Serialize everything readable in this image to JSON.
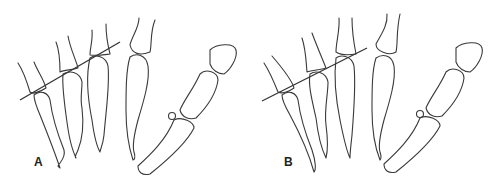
{
  "figure": {
    "panels": [
      {
        "label": "A",
        "line_color": "#333333"
      },
      {
        "label": "B",
        "line_color": "#333333"
      }
    ],
    "stroke_color": "#3a3a3a",
    "background": "#ffffff"
  }
}
